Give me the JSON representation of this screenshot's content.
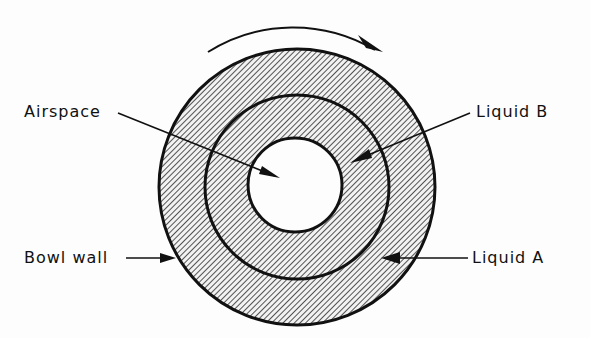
{
  "diagram": {
    "title": "",
    "labels": {
      "airspace": "Airspace",
      "liquid_b": "Liquid B",
      "bowl_wall": "Bowl wall",
      "liquid_a": "Liquid A"
    },
    "rotation_direction": "clockwise",
    "regions": [
      {
        "name": "Airspace",
        "role": "innermost empty region"
      },
      {
        "name": "Liquid B",
        "role": "inner liquid ring"
      },
      {
        "name": "Liquid A",
        "role": "outer liquid ring"
      },
      {
        "name": "Bowl wall",
        "role": "outer boundary"
      }
    ],
    "colors": {
      "ink": "#111111",
      "hatch": "#2a2a2a",
      "background": "#fdfdfd"
    }
  }
}
